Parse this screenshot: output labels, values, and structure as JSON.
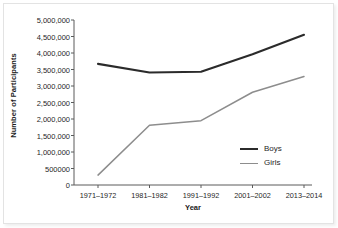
{
  "chart_data": {
    "type": "line",
    "title": "",
    "xlabel": "Year",
    "ylabel": "Number of Participants",
    "categories": [
      "1971–1972",
      "1981–1982",
      "1991–1992",
      "2001–2002",
      "2013–2014"
    ],
    "series": [
      {
        "name": "Boys",
        "color": "#2b2b2b",
        "width": 2.1,
        "values": [
          3670000,
          3410000,
          3430000,
          3960000,
          4550000
        ]
      },
      {
        "name": "Girls",
        "color": "#8d8d8d",
        "width": 1.5,
        "values": [
          300000,
          1810000,
          1950000,
          2810000,
          3290000
        ]
      }
    ],
    "ylim": [
      0,
      5000000
    ],
    "ytick_values": [
      0,
      500000,
      1000000,
      1500000,
      2000000,
      2500000,
      3000000,
      3500000,
      4000000,
      4500000,
      5000000
    ],
    "ytick_labels": [
      "0",
      "500000",
      "1,000,000",
      "1,500,000",
      "2,000,000",
      "2,500,000",
      "3,000,000",
      "3,500,000",
      "4,000,000",
      "4,500,000",
      "5,000,000"
    ],
    "grid": false,
    "legend_position": "inside-lower-right",
    "legend_entries": [
      "Boys",
      "Girls"
    ],
    "axis_color": "#5a5a5a"
  }
}
